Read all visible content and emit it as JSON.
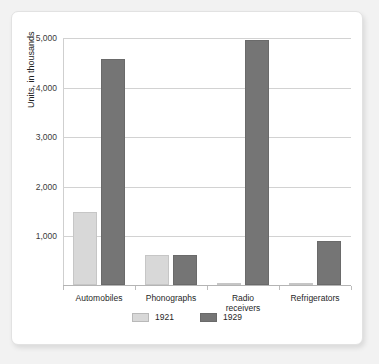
{
  "chart_data": {
    "type": "bar",
    "title": "",
    "xlabel": "",
    "ylabel": "Units, in thousands",
    "categories": [
      "Automobiles",
      "Phonographs",
      "Radio\nreceivers",
      "Refrigerators"
    ],
    "ytick_labels": [
      "1,000",
      "2,000",
      "3,000",
      "4,000",
      "5,000"
    ],
    "ytick_values": [
      1000,
      2000,
      3000,
      4000,
      5000
    ],
    "ylim": [
      0,
      5000
    ],
    "grid": "horizontal",
    "legend_position": "bottom-center",
    "series": [
      {
        "name": "1921",
        "color": "#d8d8d8",
        "values": [
          1480,
          600,
          5,
          5
        ]
      },
      {
        "name": "1929",
        "color": "#757575",
        "values": [
          4560,
          610,
          4940,
          890
        ]
      }
    ]
  },
  "colors": {
    "page_background": "#f2f2f2",
    "card_background": "#ffffff",
    "gridline": "#d2d2d2",
    "axis": "#b4b4b4",
    "text": "#1f1f1f",
    "series_1921": "#d8d8d8",
    "series_1929": "#757575"
  }
}
